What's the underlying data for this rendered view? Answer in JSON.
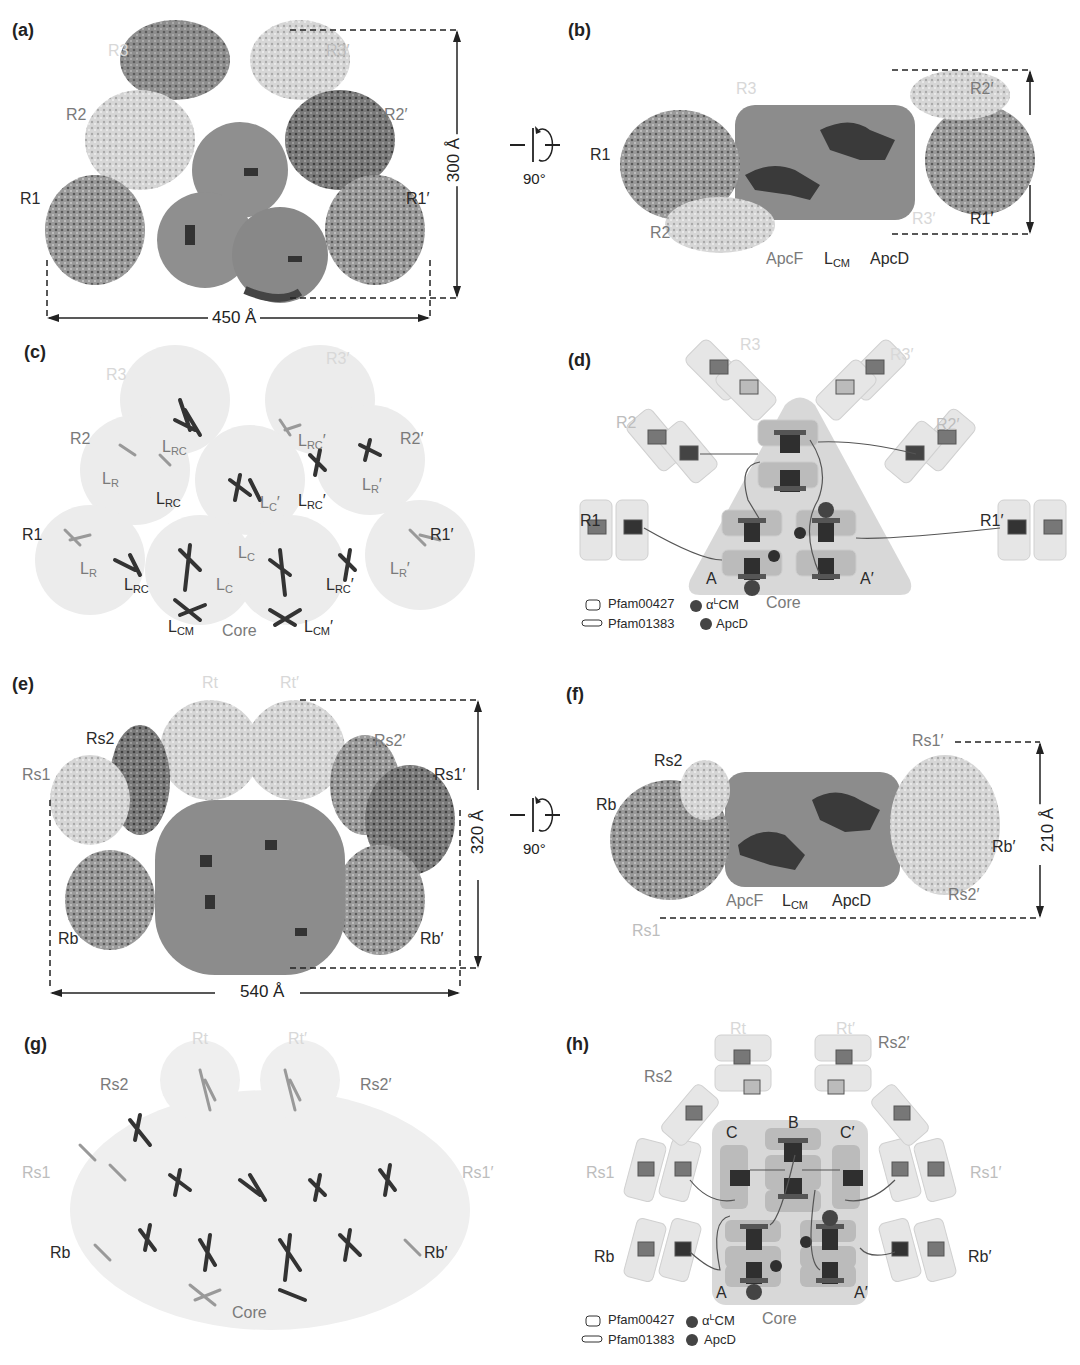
{
  "figure": {
    "panels": {
      "a": {
        "label": "(a)",
        "rod_labels": {
          "R1": "R1",
          "R2": "R2",
          "R3": "R3",
          "R1p": "R1′",
          "R2p": "R2′",
          "R3p": "R3′"
        },
        "width_dim": "450 Å",
        "height_dim": "300 Å"
      },
      "rotation": {
        "angle": "90°"
      },
      "b": {
        "label": "(b)",
        "labels": {
          "R1": "R1",
          "R2": "R2",
          "R3": "R3",
          "R1p": "R1′",
          "R2p": "R2′",
          "R3p": "R3′",
          "ApcF": "ApcF",
          "LCM": "L",
          "LCM_sub": "CM",
          "ApcD": "ApcD"
        }
      },
      "c": {
        "label": "(c)",
        "labels": {
          "R1": "R1",
          "R2": "R2",
          "R3": "R3",
          "R1p": "R1′",
          "R2p": "R2′",
          "R3p": "R3′",
          "core": "Core",
          "L": "L",
          "R": "R",
          "RC": "RC",
          "C": "C",
          "CM": "CM",
          "prime": "′"
        }
      },
      "d": {
        "label": "(d)",
        "labels": {
          "R1": "R1",
          "R2": "R2",
          "R3": "R3",
          "R1p": "R1′",
          "R2p": "R2′",
          "R3p": "R3′",
          "core": "Core",
          "A": "A",
          "Ap": "A′"
        },
        "core_numbers": [
          "3′",
          "3",
          "2",
          "1",
          "1′",
          "2′"
        ],
        "legend": [
          {
            "symbol": "rounded-rect",
            "text": "Pfam00427"
          },
          {
            "symbol": "flat-rect",
            "text": "Pfam01383"
          },
          {
            "symbol": "alpha-circle",
            "text": "α",
            "sup": "L",
            "suffix": "CM"
          },
          {
            "symbol": "filled-circle",
            "text": "ApcD"
          }
        ]
      },
      "e": {
        "label": "(e)",
        "rod_labels": {
          "Rs1": "Rs1",
          "Rs2": "Rs2",
          "Rt": "Rt",
          "Rtp": "Rt′",
          "Rs2p": "Rs2′",
          "Rs1p": "Rs1′",
          "Rb": "Rb",
          "Rbp": "Rb′"
        },
        "width_dim": "540 Å",
        "height_dim": "320 Å"
      },
      "f": {
        "label": "(f)",
        "labels": {
          "Rs1": "Rs1",
          "Rs2": "Rs2",
          "Rb": "Rb",
          "Rs1p": "Rs1′",
          "Rs2p": "Rs2′",
          "Rbp": "Rb′",
          "ApcF": "ApcF",
          "LCM": "L",
          "LCM_sub": "CM",
          "ApcD": "ApcD"
        },
        "height_dim": "210 Å"
      },
      "g": {
        "label": "(g)",
        "labels": {
          "Rt": "Rt",
          "Rtp": "Rt′",
          "Rs2": "Rs2",
          "Rs2p": "Rs2′",
          "Rs1": "Rs1",
          "Rs1p": "Rs1′",
          "Rb": "Rb",
          "Rbp": "Rb′",
          "core": "Core"
        }
      },
      "h": {
        "label": "(h)",
        "labels": {
          "Rt": "Rt",
          "Rtp": "Rt′",
          "Rs2": "Rs2",
          "Rs2p": "Rs2′",
          "Rs1": "Rs1",
          "Rs1p": "Rs1′",
          "Rb": "Rb",
          "Rbp": "Rb′",
          "core": "Core",
          "A": "A",
          "Ap": "A′",
          "B": "B",
          "C": "C",
          "Cp": "C′"
        },
        "core_numbers": [
          "3′",
          "3",
          "4′",
          "4",
          "2",
          "1",
          "1′",
          "2′"
        ],
        "legend": [
          {
            "symbol": "rounded-rect",
            "text": "Pfam00427"
          },
          {
            "symbol": "flat-rect",
            "text": "Pfam01383"
          },
          {
            "symbol": "alpha-circle",
            "text": "α",
            "sup": "L",
            "suffix": "CM"
          },
          {
            "symbol": "filled-circle",
            "text": "ApcD"
          }
        ]
      }
    }
  }
}
